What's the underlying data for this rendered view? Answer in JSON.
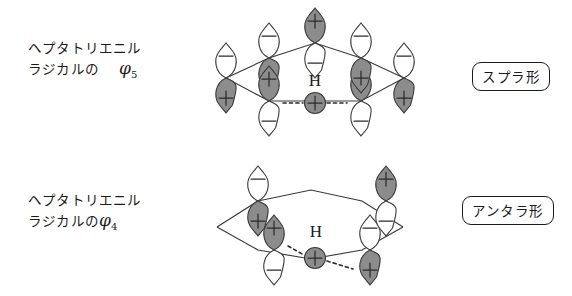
{
  "figure": {
    "colors": {
      "lobe_shaded": "#8c8c8c",
      "lobe_empty": "#ffffff",
      "stroke": "#3a3a3a",
      "text": "#1b1b1b",
      "background": "#ffffff"
    }
  },
  "panels": [
    {
      "id": "top",
      "label": {
        "line1": "ヘプタトリエニル",
        "line2": "ラジカルの",
        "orbital_symbol": "φ",
        "orbital_subscript": "5"
      },
      "tag": "スプラ形",
      "migrating_atom": "H",
      "orbital_count": 7,
      "signs_upper": [
        "−",
        "−",
        "+",
        "−",
        "+",
        "−",
        "−"
      ],
      "signs_lower": [
        "+",
        "+",
        "−",
        "+",
        "−",
        "+",
        "+"
      ]
    },
    {
      "id": "bottom",
      "label": {
        "line1": "ヘプタトリエニル",
        "line2": "ラジカルの",
        "orbital_symbol": "φ",
        "orbital_subscript": "4"
      },
      "tag": "アンタラ形",
      "migrating_atom": "H",
      "orbital_count": 4,
      "signs_upper": [
        "−",
        "+",
        "−",
        "+"
      ],
      "signs_lower": [
        "+",
        "−",
        "+",
        "−"
      ]
    }
  ],
  "glyphs": {
    "plus": "+",
    "minus": "−",
    "hydrogen": "H"
  }
}
